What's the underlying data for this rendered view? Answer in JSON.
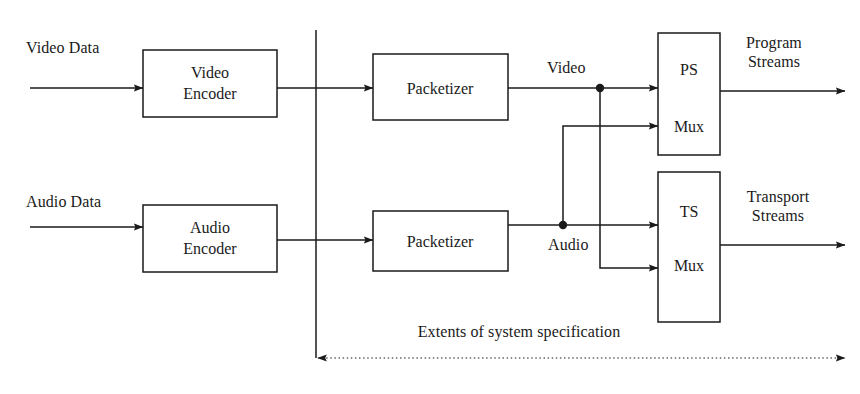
{
  "diagram": {
    "caption": "Extents of system specification",
    "stroke_color": "#1a1a1a",
    "background_color": "#ffffff",
    "inputs": [
      {
        "id": "video-data",
        "label": "Video Data"
      },
      {
        "id": "audio-data",
        "label": "Audio Data"
      }
    ],
    "blocks": [
      {
        "id": "video-encoder",
        "line1": "Video",
        "line2": "Encoder",
        "x": 143,
        "y": 50,
        "w": 134,
        "h": 67
      },
      {
        "id": "audio-encoder",
        "line1": "Audio",
        "line2": "Encoder",
        "x": 143,
        "y": 205,
        "w": 134,
        "h": 67
      },
      {
        "id": "video-packetizer",
        "line1": "Packetizer",
        "line2": "",
        "x": 373,
        "y": 54,
        "w": 135,
        "h": 66
      },
      {
        "id": "audio-packetizer",
        "line1": "Packetizer",
        "line2": "",
        "x": 373,
        "y": 211,
        "w": 135,
        "h": 60
      },
      {
        "id": "ps-mux",
        "line1": "PS",
        "line2": "Mux",
        "x": 658,
        "y": 33,
        "w": 62,
        "h": 122
      },
      {
        "id": "ts-mux",
        "line1": "TS",
        "line2": "Mux",
        "x": 658,
        "y": 172,
        "w": 62,
        "h": 150
      }
    ],
    "signal_labels": [
      {
        "id": "video-signal",
        "label": "Video"
      },
      {
        "id": "audio-signal",
        "label": "Audio"
      }
    ],
    "outputs": [
      {
        "id": "program-streams",
        "line1": "Program",
        "line2": "Streams"
      },
      {
        "id": "transport-streams",
        "line1": "Transport",
        "line2": "Streams"
      }
    ]
  }
}
